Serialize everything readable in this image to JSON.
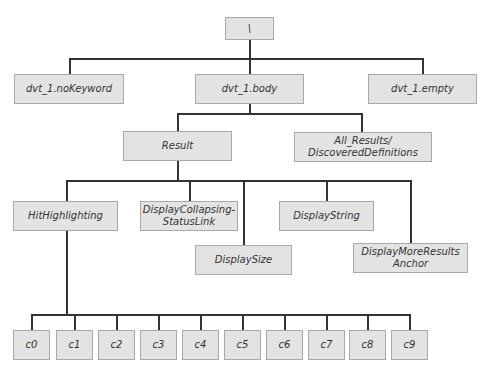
{
  "diagram": {
    "type": "tree",
    "root": {
      "label": "\\"
    },
    "level1": [
      {
        "label": "dvt_1.noKeyword"
      },
      {
        "label": "dvt_1.body"
      },
      {
        "label": "dvt_1.empty"
      }
    ],
    "body_children": [
      {
        "label": "Result"
      },
      {
        "label": "All_Results/\nDiscoveredDefinitions"
      }
    ],
    "result_children": [
      {
        "label": "HitHighlighting"
      },
      {
        "label": "DisplayCollapsing-\nStatusLink"
      },
      {
        "label": "DisplaySize"
      },
      {
        "label": "DisplayString"
      },
      {
        "label": "DisplayMoreResults\nAnchor"
      }
    ],
    "hithighlighting_children": [
      {
        "label": "c0"
      },
      {
        "label": "c1"
      },
      {
        "label": "c2"
      },
      {
        "label": "c3"
      },
      {
        "label": "c4"
      },
      {
        "label": "c5"
      },
      {
        "label": "c6"
      },
      {
        "label": "c7"
      },
      {
        "label": "c8"
      },
      {
        "label": "c9"
      }
    ],
    "colors": {
      "node_fill": "#e3e3e3",
      "node_border": "#a9a9a9",
      "connector": "#333333"
    }
  }
}
